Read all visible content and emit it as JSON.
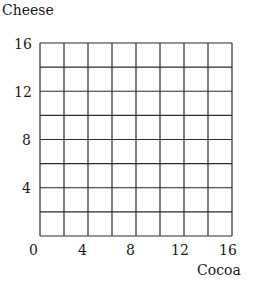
{
  "chart_data": {
    "type": "scatter",
    "title": "",
    "xlabel": "Cocoa",
    "ylabel": "Cheese",
    "xlim": [
      0,
      16
    ],
    "ylim": [
      0,
      16
    ],
    "grid": true,
    "grid_step": 2,
    "x_ticks": [
      "0",
      "4",
      "8",
      "12",
      "16"
    ],
    "y_ticks": [
      "4",
      "8",
      "12",
      "16"
    ],
    "series": [],
    "note": "Blank 8x8 grid, no data plotted"
  },
  "axes": {
    "xlabel": "Cocoa",
    "ylabel": "Cheese",
    "x_ticks": [
      "0",
      "4",
      "8",
      "12",
      "16"
    ],
    "y_ticks": [
      "4",
      "8",
      "12",
      "16"
    ]
  }
}
